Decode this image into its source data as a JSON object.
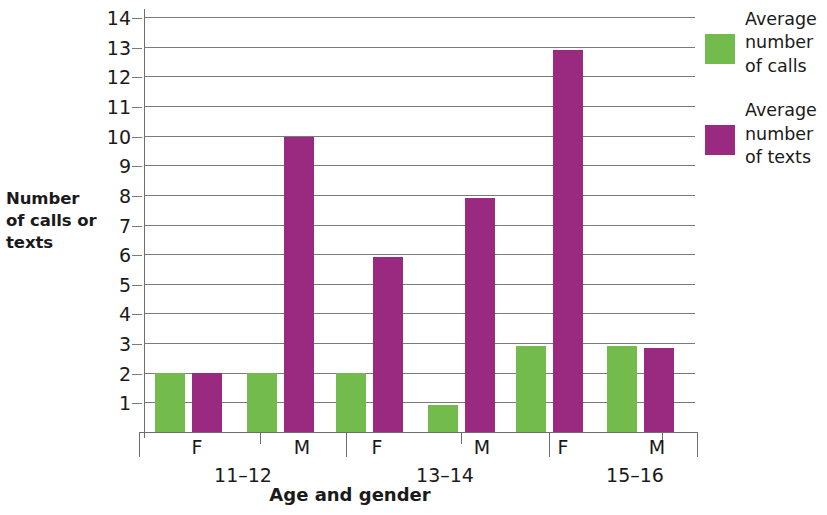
{
  "chart_data": {
    "type": "bar",
    "title": "",
    "xlabel": "Age and gender",
    "ylabel": "Number of calls or texts",
    "ylim": [
      0,
      14
    ],
    "yticks": [
      1,
      2,
      3,
      4,
      5,
      6,
      7,
      8,
      9,
      10,
      11,
      12,
      13,
      14
    ],
    "grid": true,
    "legend_position": "right",
    "categories": [
      "F",
      "M",
      "F",
      "M",
      "F",
      "M"
    ],
    "groups": [
      {
        "label": "11–12",
        "subcategories": [
          "F",
          "M"
        ]
      },
      {
        "label": "13–14",
        "subcategories": [
          "F",
          "M"
        ]
      },
      {
        "label": "15–16",
        "subcategories": [
          "F",
          "M"
        ]
      }
    ],
    "series": [
      {
        "name": "Average number of calls",
        "color": "#74bb4d",
        "values": [
          2,
          2,
          2,
          0.9,
          2.9,
          2.9
        ]
      },
      {
        "name": "Average number of texts",
        "color": "#9a2a80",
        "values": [
          2,
          9.95,
          5.9,
          7.9,
          12.9,
          2.85
        ]
      }
    ]
  },
  "axes": {
    "y_title": "Number\nof calls or\ntexts",
    "x_title": "Age and gender",
    "y_tick_labels": [
      "14",
      "13",
      "12",
      "11",
      "10",
      "9",
      "8",
      "7",
      "6",
      "5",
      "4",
      "3",
      "2",
      "1"
    ]
  },
  "legend": {
    "items": [
      {
        "label": "Average\nnumber\nof calls",
        "color": "#74bb4d",
        "icon": "green-square-swatch"
      },
      {
        "label": "Average\nnumber\nof texts",
        "color": "#9a2a80",
        "icon": "purple-square-swatch"
      }
    ]
  },
  "group_labels": [
    "11–12",
    "13–14",
    "15–16"
  ],
  "gender_labels": [
    "F",
    "M",
    "F",
    "M",
    "F",
    "M"
  ]
}
